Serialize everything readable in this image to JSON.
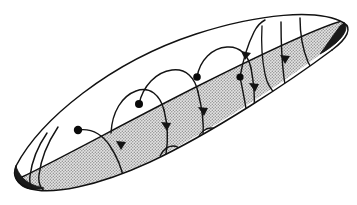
{
  "figure": {
    "title": "Spiralling flow on a lens-shaped invariant surface",
    "domain_kind": "diagram",
    "canvas": {
      "width": 357,
      "height": 205,
      "background": "#ffffff"
    },
    "colors": {
      "ink": "#111111",
      "trajectory": "#141414",
      "equilibrium": "#0a0a0a",
      "shaded_band_gray": "#b9b9b9",
      "shaded_band_light": "#d8d8d8",
      "background": "#ffffff"
    }
  },
  "outline": {
    "name": "lens-outline",
    "left_tip": {
      "x": 16,
      "y": 166
    },
    "right_tip": {
      "x": 344,
      "y": 23
    },
    "top_edge_label": "upper boundary arc",
    "bottom_edge_label": "lower boundary arc",
    "stroke_width": 1.5
  },
  "shaded_band": {
    "name": "stippled-grey-band",
    "fill": "#b9b9b9",
    "texture": "stipple",
    "spans_from": "left tip",
    "spans_to": "right tip",
    "side": "lower-right boundary"
  },
  "equilibria": {
    "count": 4,
    "radius": 4.2,
    "points": [
      {
        "id": "p1",
        "x": 78,
        "y": 130,
        "label": ""
      },
      {
        "id": "p2",
        "x": 139,
        "y": 104,
        "label": ""
      },
      {
        "id": "p3",
        "x": 197,
        "y": 77,
        "label": ""
      },
      {
        "id": "p4",
        "x": 240,
        "y": 77,
        "label": ""
      }
    ]
  },
  "trajectories": {
    "count": 7,
    "loop_count": 4,
    "loop_radius": 7,
    "direction": "downward / clockwise into the grey band",
    "arrow_count": 6,
    "notes": "Each trajectory starts at an equilibrium dot, arcs over to the right, descends steeply and terminates in a small circular self-intersection loop on the lower boundary."
  },
  "annotations": {
    "visible_text": [],
    "axis_labels": [],
    "legend": []
  }
}
